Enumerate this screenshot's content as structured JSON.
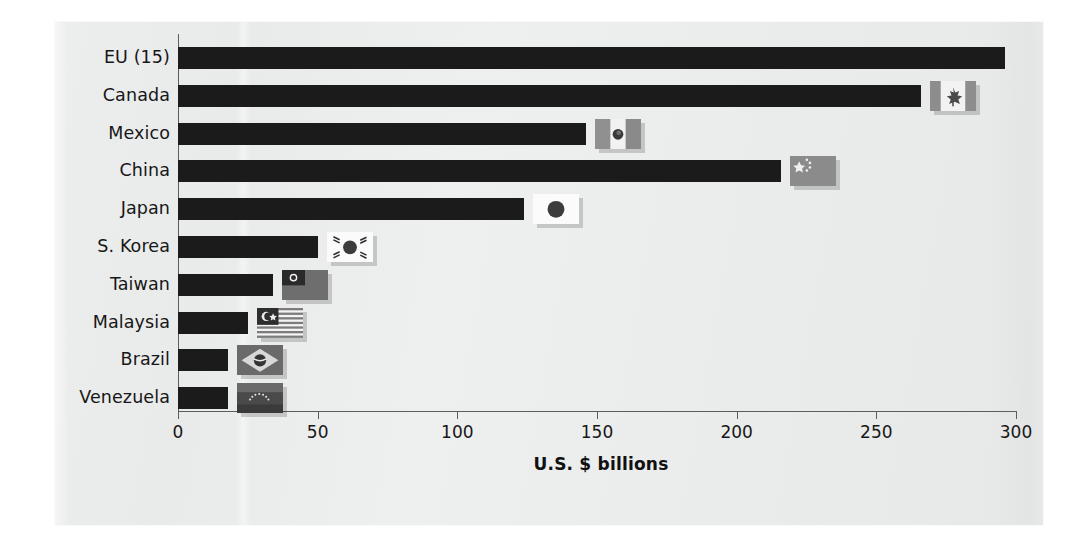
{
  "chart_data": {
    "type": "bar",
    "orientation": "horizontal",
    "title": "",
    "xlabel": "U.S. $ billions",
    "ylabel": "",
    "xlim": [
      0,
      300
    ],
    "xticks": [
      0,
      50,
      100,
      150,
      200,
      250,
      300
    ],
    "xticklabels": [
      "0",
      "50",
      "100",
      "150",
      "200",
      "250",
      "300"
    ],
    "grid": false,
    "legend": false,
    "categories": [
      "EU (15)",
      "Canada",
      "Mexico",
      "China",
      "Japan",
      "S. Korea",
      "Taiwan",
      "Malaysia",
      "Brazil",
      "Venezuela"
    ],
    "values": [
      296,
      266,
      146,
      216,
      124,
      50,
      34,
      25,
      18,
      18
    ],
    "series": [
      {
        "name": "U.S. $ billions",
        "values": [
          296,
          266,
          146,
          216,
          124,
          50,
          34,
          25,
          18,
          18
        ]
      }
    ],
    "bar_color": "#1b1b1b",
    "background_color": "#eceded",
    "annotations": [
      {
        "category": "Canada",
        "icon": "flag-canada"
      },
      {
        "category": "Mexico",
        "icon": "flag-mexico"
      },
      {
        "category": "China",
        "icon": "flag-china"
      },
      {
        "category": "Japan",
        "icon": "flag-japan"
      },
      {
        "category": "S. Korea",
        "icon": "flag-south-korea"
      },
      {
        "category": "Taiwan",
        "icon": "flag-taiwan"
      },
      {
        "category": "Malaysia",
        "icon": "flag-malaysia"
      },
      {
        "category": "Brazil",
        "icon": "flag-brazil"
      },
      {
        "category": "Venezuela",
        "icon": "flag-venezuela"
      }
    ]
  }
}
